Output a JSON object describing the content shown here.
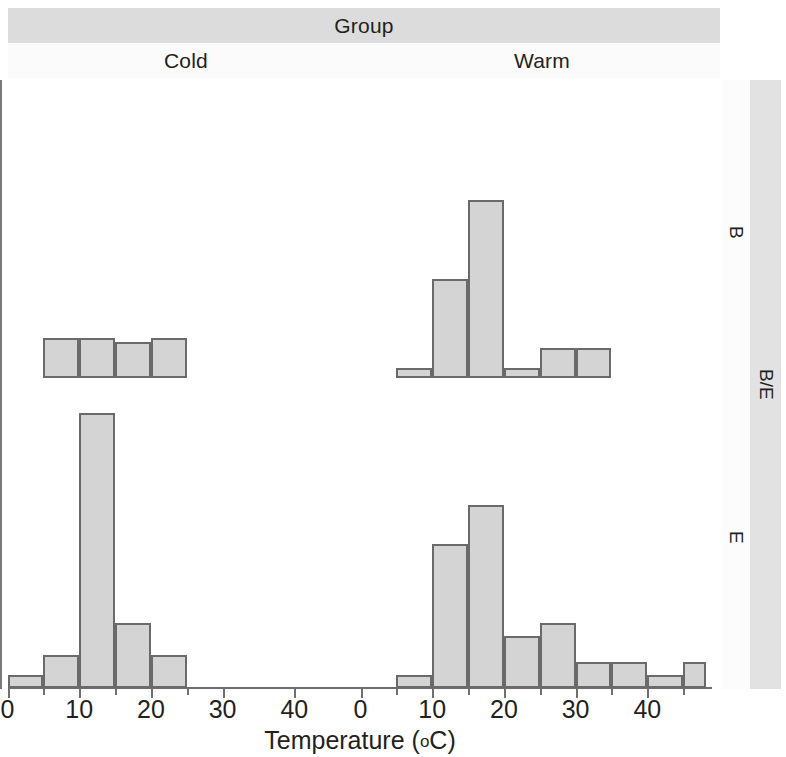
{
  "header": {
    "group_label": "Group",
    "columns": [
      "Cold",
      "Warm"
    ]
  },
  "rows": {
    "inner_labels": [
      "B",
      "E"
    ],
    "outer_label": "B/E"
  },
  "axis": {
    "x_title": "Temperature (",
    "x_title_unit": "o",
    "x_title_tail": "C)",
    "x_title_full": "Temperature (°C)",
    "cold_ticks": [
      "0",
      "10",
      "20",
      "30",
      "40"
    ],
    "warm_ticks": [
      "0",
      "10",
      "20",
      "30",
      "40"
    ]
  },
  "colors": {
    "bar_fill": "#d4d4d4",
    "bar_stroke": "#6a6a6a",
    "strip_fill": "#dcdcdc",
    "strip_light": "#fbfbfb",
    "row_strip_outer": "#e2e2e2",
    "axis": "#6f6f6f",
    "text": "#231f20"
  },
  "chart_data": {
    "type": "bar",
    "title": "Group",
    "subtitle": "",
    "xlabel": "Temperature (°C)",
    "ylabel": "",
    "grid": false,
    "legend": "none",
    "layout": "2 columns (Group: Cold, Warm) × 2 rows (B/E: B, E)",
    "bin_width": 5,
    "xlim": [
      0,
      50
    ],
    "ylim": [
      0,
      22
    ],
    "panels": [
      {
        "column": "Cold",
        "row": "B",
        "bin_starts": [
          5,
          10,
          15,
          20
        ],
        "values": [
          2,
          2,
          1.8,
          2
        ]
      },
      {
        "column": "Warm",
        "row": "B",
        "bin_starts": [
          5,
          10,
          15,
          20,
          25,
          30
        ],
        "values": [
          0.5,
          5,
          9,
          0.5,
          1.5,
          1.5
        ]
      },
      {
        "column": "Cold",
        "row": "E",
        "bin_starts": [
          0,
          5,
          10,
          15,
          20
        ],
        "values": [
          1,
          2.5,
          21,
          5,
          2.5
        ]
      },
      {
        "column": "Warm",
        "row": "E",
        "bin_starts": [
          5,
          10,
          15,
          20,
          25,
          30,
          35,
          40,
          45
        ],
        "values": [
          1,
          11,
          14,
          4,
          5,
          2,
          2,
          1,
          2
        ]
      }
    ]
  }
}
